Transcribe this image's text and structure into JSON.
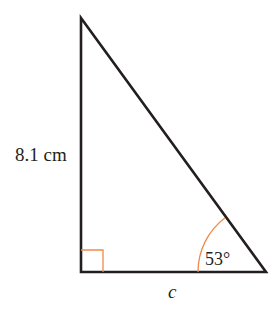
{
  "diagram": {
    "type": "right-triangle",
    "side_vertical_label": "8.1 cm",
    "side_base_label": "c",
    "angle_label": "53°",
    "right_angle_marker": true,
    "colors": {
      "stroke": "#231f20",
      "accent": "#f08a4b",
      "text": "#231f20",
      "background": "#ffffff"
    }
  }
}
